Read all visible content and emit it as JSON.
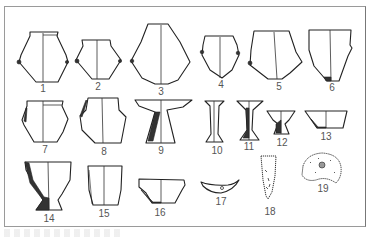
{
  "figure": {
    "items": [
      {
        "id": "1",
        "label": "1",
        "kind": "jar with lugs"
      },
      {
        "id": "2",
        "label": "2",
        "kind": "jar with lugs"
      },
      {
        "id": "3",
        "label": "3",
        "kind": "globular jar"
      },
      {
        "id": "4",
        "label": "4",
        "kind": "jar with lugs"
      },
      {
        "id": "5",
        "label": "5",
        "kind": "jar with lug"
      },
      {
        "id": "6",
        "label": "6",
        "kind": "deep bowl"
      },
      {
        "id": "7",
        "label": "7",
        "kind": "jar"
      },
      {
        "id": "8",
        "label": "8",
        "kind": "jar"
      },
      {
        "id": "9",
        "label": "9",
        "kind": "pedestal dish"
      },
      {
        "id": "10",
        "label": "10",
        "kind": "tall stand"
      },
      {
        "id": "11",
        "label": "11",
        "kind": "stand"
      },
      {
        "id": "12",
        "label": "12",
        "kind": "small pedestal cup"
      },
      {
        "id": "13",
        "label": "13",
        "kind": "bowl"
      },
      {
        "id": "14",
        "label": "14",
        "kind": "footed cup"
      },
      {
        "id": "15",
        "label": "15",
        "kind": "cup"
      },
      {
        "id": "16",
        "label": "16",
        "kind": "bowl"
      },
      {
        "id": "17",
        "label": "17",
        "kind": "crescent tool"
      },
      {
        "id": "18",
        "label": "18",
        "kind": "pointed tool"
      },
      {
        "id": "19",
        "label": "19",
        "kind": "disc"
      }
    ]
  }
}
